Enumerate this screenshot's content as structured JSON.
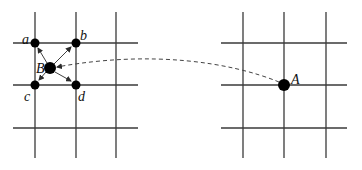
{
  "diagram": {
    "colors": {
      "grid": "#3a3a3a",
      "point": "#000000",
      "arrow": "#2a2a2a",
      "dashed": "#444444",
      "background": "#ffffff"
    },
    "left_grid": {
      "vertical_x": [
        35,
        76,
        116
      ],
      "horizontal_y": [
        43,
        85,
        128
      ],
      "x_span": [
        13,
        138
      ],
      "y_span": [
        12,
        158
      ]
    },
    "right_grid": {
      "vertical_x": [
        243,
        284,
        326
      ],
      "horizontal_y": [
        43,
        85,
        128
      ],
      "x_span": [
        221,
        347
      ],
      "y_span": [
        12,
        158
      ]
    },
    "points": {
      "a": {
        "label": "a",
        "x": 35,
        "y": 43
      },
      "b": {
        "label": "b",
        "x": 76,
        "y": 43
      },
      "c": {
        "label": "c",
        "x": 35,
        "y": 85
      },
      "d": {
        "label": "d",
        "x": 76,
        "y": 85
      },
      "B": {
        "label": "B",
        "x": 50,
        "y": 68
      },
      "A": {
        "label": "A",
        "x": 284,
        "y": 85
      }
    },
    "labels": {
      "a": "a",
      "b": "b",
      "c": "c",
      "d": "d",
      "B": "B",
      "A": "A"
    }
  }
}
